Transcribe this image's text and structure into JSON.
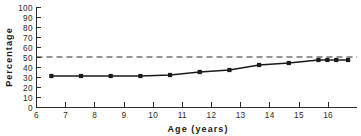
{
  "chart_data": {
    "type": "line",
    "title": "",
    "subtitle": "",
    "xlabel": "Age (years)",
    "ylabel": "Percentage",
    "xlim": [
      6,
      16.8
    ],
    "ylim": [
      0,
      100
    ],
    "grid": false,
    "legend": "none",
    "xticks": [
      6,
      7,
      8,
      9,
      10,
      11,
      12,
      13,
      14,
      15,
      16
    ],
    "xticklabels": [
      "6",
      "7",
      "8",
      "9",
      "10",
      "11",
      "12",
      "13",
      "14",
      "15",
      "16"
    ],
    "yticks": [
      0,
      10,
      20,
      30,
      40,
      50,
      60,
      70,
      80,
      90,
      100
    ],
    "yticklabels": [
      "0",
      "10",
      "20",
      "30",
      "40",
      "50",
      "60",
      "70",
      "80",
      "90",
      "100"
    ],
    "x": [
      6.5,
      7.5,
      8.5,
      9.5,
      10.5,
      11.5,
      12.5,
      13.5,
      14.5,
      15.5,
      15.8,
      16.1,
      16.5
    ],
    "values": [
      31,
      31,
      31,
      31,
      32,
      35,
      37,
      42,
      44,
      47,
      47,
      47,
      47
    ],
    "series": [
      {
        "name": "Percentage by age",
        "marker": "square",
        "color": "#1a1a1a",
        "x": [
          6.5,
          7.5,
          8.5,
          9.5,
          10.5,
          11.5,
          12.5,
          13.5,
          14.5,
          15.5,
          15.8,
          16.1,
          16.5
        ],
        "values": [
          31,
          31,
          31,
          31,
          32,
          35,
          37,
          42,
          44,
          47,
          47,
          47,
          47
        ]
      }
    ],
    "annotations": [
      {
        "name": "reference-line-50",
        "type": "hline",
        "value": 50,
        "style": "dashed",
        "color": "#2b2b2b"
      }
    ]
  }
}
